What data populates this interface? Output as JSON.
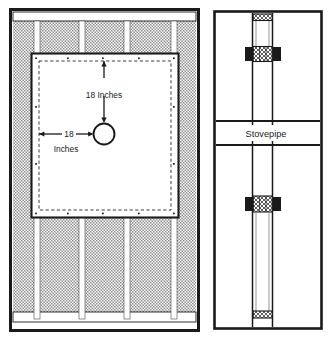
{
  "figure": {
    "panels": [
      {
        "id": "front-view",
        "name": "Front elevation of framed wall with cut opening",
        "description": "Shaded wall sheathing with vertical studs, rectangular cut-out panel with dashed clearance line and a round stovepipe hole"
      },
      {
        "id": "section-view",
        "name": "Section view through wall showing stovepipe and thimble",
        "description": "Two horizontal plates, vertical pipe with cross-hatched insulated collars"
      }
    ]
  },
  "labels": {
    "vertical_dimension": "18 Inches",
    "horizontal_dimension_value": "18",
    "horizontal_dimension_unit": "Inches",
    "stovepipe": "Stovepipe"
  },
  "colors": {
    "outline": "#1a1a1a",
    "siding_shade": "#a9a9a9",
    "panel_fill": "#ffffff",
    "background": "#ffffff",
    "dashed_line": "#1a1a1a",
    "collar_dark": "#1a1a1a"
  },
  "geometry": {
    "front_panel": {
      "x": 10,
      "y": 9,
      "w": 189,
      "h": 322
    },
    "cut_panel": {
      "x": 31,
      "y": 53,
      "w": 148,
      "h": 165
    },
    "hole": {
      "cx": 104,
      "cy": 134,
      "r": 11
    },
    "studs_x": [
      35,
      80,
      125,
      173
    ],
    "section_panel": {
      "x": 214,
      "y": 11,
      "w": 108,
      "h": 318
    }
  }
}
